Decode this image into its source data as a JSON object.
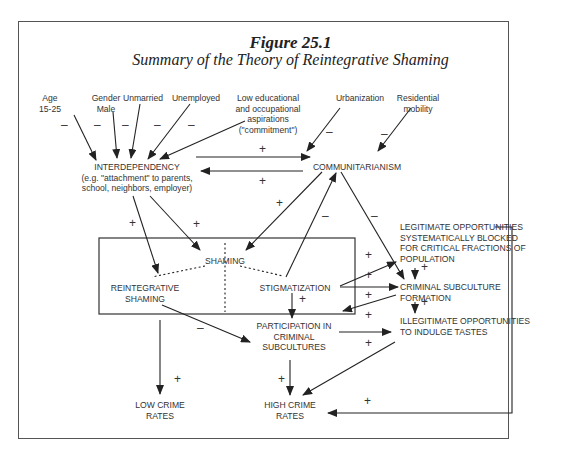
{
  "figure": {
    "number": "Figure 25.1",
    "subtitle": "Summary of the Theory of Reintegrative Shaming"
  },
  "nodes": {
    "age": "Age\n15-25",
    "gender": "Gender\nMale",
    "unmarried": "Unmarried",
    "unemployed": "Unemployed",
    "low_aspirations": "Low educational\nand occupational\naspirations\n(\"commitment\")",
    "urbanization": "Urbanization",
    "residential_mobility": "Residential\nmobility",
    "interdependency": "INTERDEPENDENCY\n(e.g. \"attachment\" to parents,\nschool, neighbors, employer)",
    "communitarianism": "COMMUNITARIANISM",
    "shaming": "SHAMING",
    "reintegrative_shaming": "REINTEGRATIVE\nSHAMING",
    "stigmatization": "STIGMATIZATION",
    "legitimate_blocked": "LEGITIMATE OPPORTUNITIES\nSYSTEMATICALLY BLOCKED\nFOR CRITICAL FRACTIONS OF\nPOPULATION",
    "criminal_subculture_formation": "CRIMINAL SUBCULTURE\nFORMATION",
    "illegitimate_opportunities": "ILLEGITIMATE OPPORTUNITIES\nTO INDULGE TASTES",
    "participation": "PARTICIPATION IN\nCRIMINAL\nSUBCULTURES",
    "low_crime": "LOW CRIME\nRATES",
    "high_crime": "HIGH CRIME\nRATES"
  },
  "signs": {
    "plus": "+",
    "minus": "–"
  },
  "edges": [
    {
      "from": "age",
      "to": "interdependency",
      "sign": "-"
    },
    {
      "from": "gender",
      "to": "interdependency",
      "sign": "-"
    },
    {
      "from": "unmarried",
      "to": "interdependency",
      "sign": "-"
    },
    {
      "from": "unemployed",
      "to": "interdependency",
      "sign": "-"
    },
    {
      "from": "low_aspirations",
      "to": "interdependency",
      "sign": "-"
    },
    {
      "from": "urbanization",
      "to": "communitarianism",
      "sign": "-"
    },
    {
      "from": "residential_mobility",
      "to": "communitarianism",
      "sign": "-"
    },
    {
      "from": "interdependency",
      "to": "communitarianism",
      "sign": "+"
    },
    {
      "from": "communitarianism",
      "to": "interdependency",
      "sign": "+"
    },
    {
      "from": "interdependency",
      "to": "reintegrative_shaming",
      "sign": "+"
    },
    {
      "from": "interdependency",
      "to": "shaming",
      "sign": "+"
    },
    {
      "from": "communitarianism",
      "to": "shaming",
      "sign": "+"
    },
    {
      "from": "stigmatization",
      "to": "communitarianism",
      "sign": "-"
    },
    {
      "from": "communitarianism",
      "to": "criminal_subculture_formation",
      "sign": "-"
    },
    {
      "from": "stigmatization",
      "to": "legitimate_blocked",
      "sign": "+"
    },
    {
      "from": "stigmatization",
      "to": "criminal_subculture_formation",
      "sign": "+"
    },
    {
      "from": "criminal_subculture_formation",
      "to": "participation",
      "sign": "+"
    },
    {
      "from": "stigmatization",
      "to": "participation",
      "sign": "+"
    },
    {
      "from": "reintegrative_shaming",
      "to": "participation",
      "sign": "-"
    },
    {
      "from": "participation",
      "to": "illegitimate_opportunities",
      "sign": "+"
    },
    {
      "from": "illegitimate_opportunities",
      "to": "high_crime",
      "sign": "+"
    },
    {
      "from": "legitimate_blocked",
      "to": "criminal_subculture_formation",
      "sign": "+"
    },
    {
      "from": "criminal_subculture_formation",
      "to": "illegitimate_opportunities",
      "sign": "+"
    },
    {
      "from": "reintegrative_shaming",
      "to": "low_crime",
      "sign": "+"
    },
    {
      "from": "participation",
      "to": "high_crime",
      "sign": "+"
    },
    {
      "from": "legitimate_blocked",
      "to": "high_crime",
      "sign": "+"
    }
  ]
}
